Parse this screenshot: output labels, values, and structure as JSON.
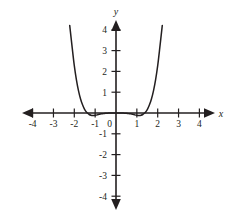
{
  "figure": {
    "name": "coordinate-plane-quartic-graph",
    "background_color": "#ffffff",
    "ink_color": "#231f20",
    "axis_labels": {
      "x": "x",
      "y": "y"
    },
    "origin_label": "0"
  },
  "chart_data": {
    "type": "line",
    "title": "",
    "xlabel": "x",
    "ylabel": "y",
    "xlim": [
      -4.4,
      4.4
    ],
    "ylim": [
      -4.4,
      4.4
    ],
    "grid": false,
    "legend": null,
    "x_ticks": [
      -4,
      -3,
      -2,
      -1,
      1,
      2,
      3,
      4
    ],
    "x_tick_labels": [
      "-4",
      "-3",
      "-2",
      "-1",
      "1",
      "2",
      "3",
      "4"
    ],
    "y_ticks": [
      -4,
      -3,
      -2,
      -1,
      1,
      2,
      3,
      4
    ],
    "y_tick_labels": [
      "-4",
      "-3",
      "-2",
      "-1",
      "1",
      "2",
      "3",
      "4"
    ],
    "origin_tick_label": "0",
    "axes_arrows": [
      "left",
      "right",
      "up",
      "down"
    ],
    "series": [
      {
        "name": "quartic-curve",
        "color": "#231f20",
        "description": "W-shaped even-degree polynomial with local maximum at the origin and two local minima just below the x-axis",
        "x": [
          -2.22,
          -2.1,
          -2.0,
          -1.9,
          -1.8,
          -1.7,
          -1.6,
          -1.5,
          -1.4,
          -1.3,
          -1.2,
          -1.1,
          -1.0,
          -0.9,
          -0.8,
          -0.7,
          -0.6,
          -0.5,
          -0.4,
          -0.3,
          -0.2,
          -0.1,
          0.0,
          0.1,
          0.2,
          0.3,
          0.4,
          0.5,
          0.6,
          0.7,
          0.8,
          0.9,
          1.0,
          1.1,
          1.2,
          1.3,
          1.4,
          1.5,
          1.6,
          1.7,
          1.8,
          1.9,
          2.0,
          2.1,
          2.22
        ],
        "y": [
          4.2,
          3.12,
          2.27,
          1.6,
          1.07,
          0.67,
          0.38,
          0.16,
          0.02,
          -0.06,
          -0.11,
          -0.12,
          -0.11,
          -0.09,
          -0.06,
          -0.04,
          -0.03,
          -0.01,
          -0.01,
          0.0,
          0.0,
          0.0,
          0.0,
          0.0,
          0.0,
          0.0,
          -0.01,
          -0.01,
          -0.03,
          -0.04,
          -0.06,
          -0.09,
          -0.11,
          -0.12,
          -0.11,
          -0.06,
          0.02,
          0.16,
          0.38,
          0.67,
          1.07,
          1.6,
          2.27,
          3.12,
          4.2
        ]
      }
    ],
    "key_features": {
      "local_maximum": {
        "x": 0,
        "y": 0
      },
      "local_minima": [
        {
          "x": -1.15,
          "y": -0.12
        },
        {
          "x": 1.15,
          "y": -0.12
        }
      ],
      "x_intercepts": [
        -1.38,
        0,
        1.38
      ],
      "end_behavior": "both ends rise"
    }
  }
}
